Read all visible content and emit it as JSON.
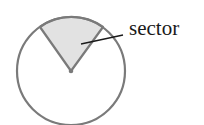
{
  "diagram": {
    "type": "circle-sector",
    "label": "sector",
    "colors": {
      "circle_stroke": "#7a7a7a",
      "sector_fill": "#e2e2e2",
      "leader_line": "#1a1a1a",
      "text": "#1a1a1a"
    }
  }
}
